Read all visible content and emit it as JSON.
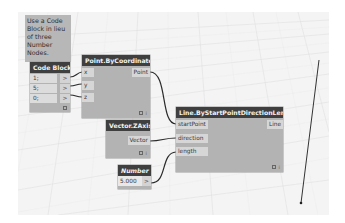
{
  "note": {
    "text": "Use a Code Block in lieu of three Number Nodes."
  },
  "code_block": {
    "title": "Code Block",
    "lines": [
      "1;",
      "5;",
      "0;"
    ],
    "outputs": [
      ">",
      ">",
      ">"
    ]
  },
  "point_node": {
    "title": "Point.ByCoordinates",
    "inputs": [
      "x",
      "y",
      "z"
    ],
    "output": "Point"
  },
  "vector_node": {
    "title": "Vector.ZAxis",
    "output": "Vector"
  },
  "number_node": {
    "title": "Number",
    "value": "5.000",
    "output": ">"
  },
  "line_node": {
    "title": "Line.ByStartPointDirectionLength",
    "inputs": [
      "startPoint",
      "direction",
      "length"
    ],
    "output": "Line"
  },
  "footer_icons": {
    "preview": "preview-icon",
    "info": "i"
  },
  "colors": {
    "node_header": "#3f3f3f",
    "node_body": "#b3b3b3",
    "port": "#d6d6d6",
    "note_bg": "#b7b7b7",
    "canvas": "#f4f4f4",
    "wire": "#2a2a2a"
  }
}
